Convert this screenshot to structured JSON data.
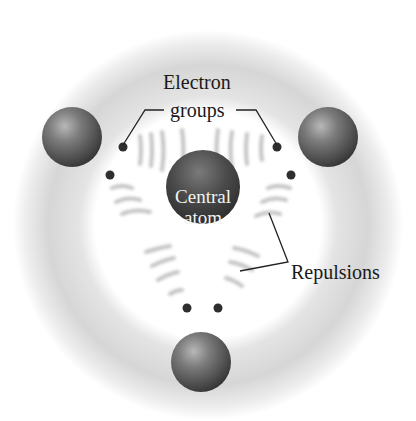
{
  "diagram": {
    "labels": {
      "electron_groups_line1": "Electron",
      "electron_groups_line2": "groups",
      "central_atom_line1": "Central",
      "central_atom_line2": "atom",
      "repulsions": "Repulsions"
    },
    "colors": {
      "sphere_dark": "#3a3a3a",
      "sphere_light": "#9a9a9a",
      "halo": "#d8d8d8",
      "dot": "#2e2e2e",
      "line": "#222222"
    },
    "geometry": "trigonal planar",
    "outer_atoms": 3,
    "electron_pairs": 3
  }
}
